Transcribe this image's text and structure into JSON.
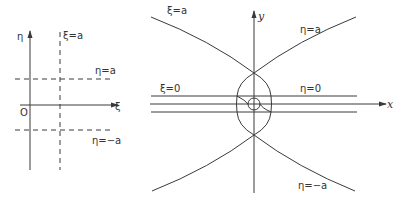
{
  "left_diagram": {
    "axis_vertical_label": "η",
    "axis_horizontal_label": "ξ",
    "origin_label": "O",
    "lines": [
      {
        "label": "ξ=a",
        "style": "dashed",
        "orientation": "vertical"
      },
      {
        "label": "η=a",
        "style": "dashed",
        "orientation": "horizontal"
      },
      {
        "label": "η=−a",
        "style": "dashed",
        "orientation": "horizontal"
      }
    ]
  },
  "right_diagram": {
    "axis_vertical_label": "y",
    "axis_horizontal_label": "x",
    "curves": [
      {
        "label": "ξ=a"
      },
      {
        "label": "η=a"
      },
      {
        "label": "ξ=0"
      },
      {
        "label": "η=0"
      },
      {
        "label": "η=−a"
      }
    ]
  }
}
